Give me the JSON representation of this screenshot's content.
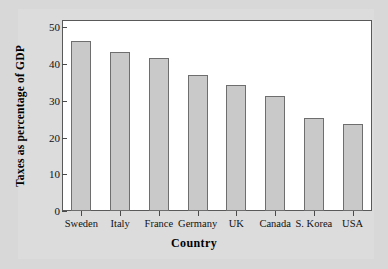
{
  "chart_data": {
    "type": "bar",
    "title": "",
    "subtitle": "",
    "xlabel": "Country",
    "ylabel": "Taxes as percentage of GDP",
    "categories": [
      "Sweden",
      "Italy",
      "France",
      "Germany",
      "UK",
      "Canada",
      "S. Korea",
      "USA"
    ],
    "values": [
      46.3,
      43.3,
      41.7,
      37.0,
      34.3,
      31.2,
      25.3,
      23.8
    ],
    "ylim": [
      0,
      52
    ],
    "yticks": [
      0,
      10,
      20,
      30,
      40,
      50
    ],
    "ytick_labels": [
      "0",
      "10",
      "20",
      "30",
      "40",
      "50"
    ],
    "grid": false,
    "legend": false,
    "legend_position": "none",
    "bar_fill_color": "#c9c9c9",
    "bar_edge_color": "#6e6e6e",
    "plot_background_color": "#ffffff",
    "figure_background_color": "#dcdcdc",
    "axis_color": "#595959"
  },
  "axis": {
    "y_title": "Taxes as percentage of GDP",
    "x_title": "Country"
  }
}
